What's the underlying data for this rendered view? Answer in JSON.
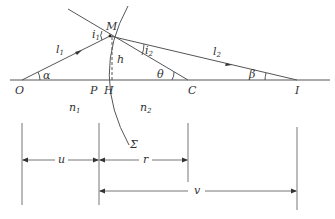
{
  "diagram": {
    "type": "optics-refraction-spherical-surface",
    "points": {
      "O": "O",
      "M": "M",
      "P": "P",
      "H": "H",
      "C": "C",
      "I": "I"
    },
    "rays": {
      "incident": {
        "name": "l",
        "sub": "1"
      },
      "refracted": {
        "name": "l",
        "sub": "2"
      }
    },
    "angles": {
      "incidence": {
        "name": "i",
        "sub": "1"
      },
      "refraction": {
        "name": "i",
        "sub": "2"
      },
      "alpha": "α",
      "beta": "β",
      "theta": "θ"
    },
    "height_label": "h",
    "media": {
      "n1": {
        "name": "n",
        "sub": "1"
      },
      "n2": {
        "name": "n",
        "sub": "2"
      }
    },
    "surface_label": "Σ",
    "dimensions": {
      "u": "u",
      "r": "r",
      "v": "v"
    },
    "colors": {
      "line": "#555555",
      "dimension": "#777777",
      "text": "#333333",
      "background": "#ffffff"
    }
  }
}
